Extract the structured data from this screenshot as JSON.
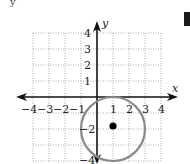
{
  "figure": {
    "top_fragment": "y",
    "axes": {
      "x_label": "x",
      "y_label": "y",
      "x_ticks": [
        "−4",
        "−3",
        "−2",
        "−1",
        "1",
        "2",
        "3",
        "4"
      ],
      "y_ticks": [
        "4",
        "3",
        "2",
        "1",
        "−2",
        "−4"
      ]
    },
    "circle": {
      "center": [
        1,
        -2
      ],
      "radius": 2,
      "stroke_color": "#8a8a8a"
    },
    "center_point": {
      "x": 1,
      "y": -2,
      "color": "#000000"
    },
    "grid": {
      "xmin": -4,
      "xmax": 4,
      "ymin": -4,
      "ymax": 4,
      "style": "dotted"
    }
  }
}
